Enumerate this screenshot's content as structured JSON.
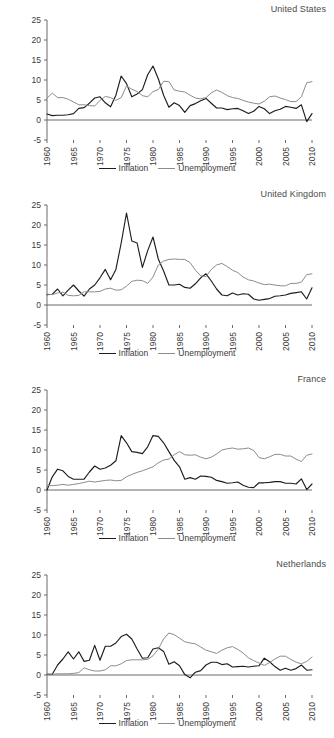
{
  "figure": {
    "legend": {
      "inflation_label": "Inflation",
      "unemployment_label": "Unemployment"
    },
    "colors": {
      "inflation": "#1d1d1d",
      "unemployment": "#8c8c8c",
      "axis": "#6b6b6b",
      "text": "#3a3a3a"
    }
  },
  "chart_data": [
    {
      "type": "line",
      "title": "United States",
      "xlabel": "",
      "ylabel": "",
      "xlim": [
        1960,
        2010
      ],
      "ylim": [
        -5,
        25
      ],
      "ytick_labels": [
        "25",
        "20",
        "15",
        "10",
        "5",
        "0",
        "-5"
      ],
      "yticks": [
        25,
        20,
        15,
        10,
        5,
        0,
        -5
      ],
      "xtick_labels": [
        "1960",
        "1965",
        "1970",
        "1975",
        "1980",
        "1985",
        "1990",
        "1995",
        "2000",
        "2005",
        "2010"
      ],
      "xticks": [
        1960,
        1965,
        1970,
        1975,
        1980,
        1985,
        1990,
        1995,
        2000,
        2005,
        2010
      ],
      "grid": false,
      "legend_position": "bottom-center",
      "x": [
        1960,
        1961,
        1962,
        1963,
        1964,
        1965,
        1966,
        1967,
        1968,
        1969,
        1970,
        1971,
        1972,
        1973,
        1974,
        1975,
        1976,
        1977,
        1978,
        1979,
        1980,
        1981,
        1982,
        1983,
        1984,
        1985,
        1986,
        1987,
        1988,
        1989,
        1990,
        1991,
        1992,
        1993,
        1994,
        1995,
        1996,
        1997,
        1998,
        1999,
        2000,
        2001,
        2002,
        2003,
        2004,
        2005,
        2006,
        2007,
        2008,
        2009,
        2010
      ],
      "series": [
        {
          "name": "Inflation",
          "color": "#1d1d1d",
          "values": [
            1.5,
            1.1,
            1.2,
            1.2,
            1.3,
            1.6,
            2.9,
            3.1,
            4.2,
            5.5,
            5.8,
            4.3,
            3.3,
            6.2,
            11.0,
            9.1,
            5.8,
            6.5,
            7.6,
            11.3,
            13.5,
            10.3,
            6.2,
            3.2,
            4.3,
            3.6,
            1.9,
            3.6,
            4.1,
            4.8,
            5.4,
            4.2,
            3.0,
            3.0,
            2.6,
            2.8,
            2.9,
            2.3,
            1.6,
            2.2,
            3.4,
            2.8,
            1.6,
            2.3,
            2.7,
            3.4,
            3.2,
            2.9,
            3.8,
            -0.4,
            1.6
          ]
        },
        {
          "name": "Unemployment",
          "color": "#8c8c8c",
          "values": [
            5.5,
            6.7,
            5.6,
            5.6,
            5.2,
            4.5,
            3.8,
            3.8,
            3.6,
            3.5,
            4.9,
            5.9,
            5.6,
            4.9,
            5.6,
            8.5,
            7.7,
            7.1,
            6.1,
            5.8,
            7.1,
            7.6,
            9.7,
            9.6,
            7.5,
            7.2,
            7.0,
            6.2,
            5.5,
            5.3,
            5.6,
            6.8,
            7.5,
            6.9,
            6.1,
            5.6,
            5.4,
            4.9,
            4.5,
            4.2,
            4.0,
            4.7,
            5.8,
            6.0,
            5.5,
            5.1,
            4.6,
            4.6,
            5.8,
            9.3,
            9.6
          ]
        }
      ]
    },
    {
      "type": "line",
      "title": "United Kingdom",
      "xlabel": "",
      "ylabel": "",
      "xlim": [
        1960,
        2010
      ],
      "ylim": [
        -5,
        25
      ],
      "ytick_labels": [
        "25",
        "20",
        "15",
        "10",
        "5",
        "0",
        "-5"
      ],
      "yticks": [
        25,
        20,
        15,
        10,
        5,
        0,
        -5
      ],
      "xtick_labels": [
        "1960",
        "1965",
        "1970",
        "1975",
        "1980",
        "1985",
        "1990",
        "1995",
        "2000",
        "2005",
        "2010"
      ],
      "xticks": [
        1960,
        1965,
        1970,
        1975,
        1980,
        1985,
        1990,
        1995,
        2000,
        2005,
        2010
      ],
      "grid": false,
      "legend_position": "bottom-center",
      "x": [
        1960,
        1961,
        1962,
        1963,
        1964,
        1965,
        1966,
        1967,
        1968,
        1969,
        1970,
        1971,
        1972,
        1973,
        1974,
        1975,
        1976,
        1977,
        1978,
        1979,
        1980,
        1981,
        1982,
        1983,
        1984,
        1985,
        1986,
        1987,
        1988,
        1989,
        1990,
        1991,
        1992,
        1993,
        1994,
        1995,
        1996,
        1997,
        1998,
        1999,
        2000,
        2001,
        2002,
        2003,
        2004,
        2005,
        2006,
        2007,
        2008,
        2009,
        2010
      ],
      "series": [
        {
          "name": "Inflation",
          "color": "#1d1d1d",
          "values": [
            2.6,
            2.7,
            4.0,
            2.3,
            3.7,
            5.0,
            3.5,
            2.2,
            4.0,
            5.0,
            6.8,
            8.9,
            6.3,
            8.9,
            15.5,
            23.0,
            16.0,
            15.5,
            9.4,
            13.6,
            17.0,
            11.5,
            8.5,
            5.0,
            5.0,
            5.2,
            4.4,
            4.2,
            5.3,
            6.8,
            7.8,
            6.0,
            4.0,
            2.5,
            2.3,
            3.0,
            2.5,
            2.8,
            2.7,
            1.5,
            1.2,
            1.4,
            1.6,
            2.2,
            2.3,
            2.5,
            2.9,
            3.1,
            3.3,
            1.5,
            4.3
          ]
        },
        {
          "name": "Unemployment",
          "color": "#8c8c8c",
          "values": [
            2.7,
            2.6,
            3.0,
            3.2,
            2.4,
            2.3,
            2.4,
            3.3,
            3.3,
            3.3,
            3.4,
            4.0,
            4.2,
            3.7,
            3.8,
            4.7,
            5.9,
            6.2,
            6.1,
            5.4,
            7.0,
            10.0,
            11.0,
            11.4,
            11.5,
            11.4,
            11.4,
            10.6,
            8.7,
            7.3,
            7.1,
            8.9,
            10.0,
            10.4,
            9.6,
            8.7,
            8.1,
            7.0,
            6.3,
            6.0,
            5.5,
            5.1,
            5.2,
            5.0,
            4.8,
            4.8,
            5.4,
            5.4,
            5.7,
            7.6,
            7.8
          ]
        }
      ]
    },
    {
      "type": "line",
      "title": "France",
      "xlabel": "",
      "ylabel": "",
      "xlim": [
        1960,
        2010
      ],
      "ylim": [
        -5,
        25
      ],
      "ytick_labels": [
        "25",
        "20",
        "15",
        "10",
        "5",
        "0",
        "-5"
      ],
      "yticks": [
        25,
        20,
        15,
        10,
        5,
        0,
        -5
      ],
      "xtick_labels": [
        "1960",
        "1965",
        "1970",
        "1975",
        "1980",
        "1985",
        "1990",
        "1995",
        "2000",
        "2005",
        "2010"
      ],
      "xticks": [
        1960,
        1965,
        1970,
        1975,
        1980,
        1985,
        1990,
        1995,
        2000,
        2005,
        2010
      ],
      "grid": false,
      "legend_position": "bottom-center",
      "x": [
        1960,
        1961,
        1962,
        1963,
        1964,
        1965,
        1966,
        1967,
        1968,
        1969,
        1970,
        1971,
        1972,
        1973,
        1974,
        1975,
        1976,
        1977,
        1978,
        1979,
        1980,
        1981,
        1982,
        1983,
        1984,
        1985,
        1986,
        1987,
        1988,
        1989,
        1990,
        1991,
        1992,
        1993,
        1994,
        1995,
        1996,
        1997,
        1998,
        1999,
        2000,
        2001,
        2002,
        2003,
        2004,
        2005,
        2006,
        2007,
        2008,
        2009,
        2010
      ],
      "series": [
        {
          "name": "Inflation",
          "color": "#1d1d1d",
          "values": [
            0.0,
            3.3,
            5.2,
            4.8,
            3.4,
            2.7,
            2.7,
            2.7,
            4.5,
            6.0,
            5.2,
            5.5,
            6.2,
            7.3,
            13.6,
            11.8,
            9.6,
            9.4,
            9.1,
            10.8,
            13.6,
            13.4,
            11.8,
            9.6,
            7.4,
            5.8,
            2.7,
            3.1,
            2.7,
            3.5,
            3.4,
            3.2,
            2.4,
            2.1,
            1.7,
            1.8,
            2.0,
            1.2,
            0.7,
            0.6,
            1.8,
            1.8,
            1.9,
            2.1,
            2.1,
            1.7,
            1.7,
            1.5,
            2.8,
            0.1,
            1.5
          ]
        },
        {
          "name": "Unemployment",
          "color": "#8c8c8c",
          "values": [
            1.1,
            1.1,
            1.2,
            1.4,
            1.2,
            1.4,
            1.6,
            1.9,
            2.2,
            2.0,
            2.2,
            2.4,
            2.5,
            2.3,
            2.4,
            3.3,
            3.9,
            4.4,
            4.8,
            5.3,
            5.8,
            6.8,
            7.5,
            7.7,
            8.8,
            9.6,
            8.8,
            8.7,
            8.8,
            8.2,
            7.8,
            8.2,
            9.0,
            10.0,
            10.3,
            10.5,
            10.2,
            10.3,
            10.5,
            9.9,
            8.1,
            7.8,
            8.3,
            8.9,
            8.9,
            8.5,
            8.5,
            7.7,
            7.1,
            8.7,
            9.0
          ]
        }
      ]
    },
    {
      "type": "line",
      "title": "Netherlands",
      "xlabel": "",
      "ylabel": "",
      "xlim": [
        1960,
        2010
      ],
      "ylim": [
        -5,
        25
      ],
      "ytick_labels": [
        "25",
        "20",
        "15",
        "10",
        "5",
        "0",
        "-5"
      ],
      "yticks": [
        25,
        20,
        15,
        10,
        5,
        0,
        -5
      ],
      "xtick_labels": [
        "1960",
        "1965",
        "1970",
        "1975",
        "1980",
        "1985",
        "1990",
        "1995",
        "2000",
        "2005",
        "2010"
      ],
      "xticks": [
        1960,
        1965,
        1970,
        1975,
        1980,
        1985,
        1990,
        1995,
        2000,
        2005,
        2010
      ],
      "grid": false,
      "legend_position": "bottom-center",
      "x": [
        1960,
        1961,
        1962,
        1963,
        1964,
        1965,
        1966,
        1967,
        1968,
        1969,
        1970,
        1971,
        1972,
        1973,
        1974,
        1975,
        1976,
        1977,
        1978,
        1979,
        1980,
        1981,
        1982,
        1983,
        1984,
        1985,
        1986,
        1987,
        1988,
        1989,
        1990,
        1991,
        1992,
        1993,
        1994,
        1995,
        1996,
        1997,
        1998,
        1999,
        2000,
        2001,
        2002,
        2003,
        2004,
        2005,
        2006,
        2007,
        2008,
        2009,
        2010
      ],
      "series": [
        {
          "name": "Inflation",
          "color": "#1d1d1d",
          "values": [
            0.2,
            0.2,
            2.5,
            4.0,
            5.8,
            4.0,
            5.8,
            3.4,
            3.7,
            7.4,
            3.7,
            7.2,
            7.2,
            8.0,
            9.6,
            10.2,
            9.0,
            6.5,
            4.2,
            4.3,
            6.5,
            6.8,
            5.9,
            2.7,
            3.3,
            2.3,
            0.1,
            -0.7,
            0.7,
            1.1,
            2.5,
            3.2,
            3.2,
            2.6,
            2.8,
            2.0,
            2.1,
            2.2,
            2.0,
            2.2,
            2.3,
            4.2,
            3.3,
            2.1,
            1.2,
            1.7,
            1.2,
            1.6,
            2.5,
            1.2,
            1.3
          ]
        },
        {
          "name": "Unemployment",
          "color": "#8c8c8c",
          "values": [
            0.2,
            0.2,
            0.3,
            0.3,
            0.3,
            0.4,
            0.6,
            1.8,
            1.3,
            1.0,
            1.0,
            1.3,
            2.3,
            2.3,
            2.8,
            3.6,
            3.8,
            3.8,
            3.8,
            3.9,
            4.8,
            6.5,
            9.0,
            10.5,
            10.1,
            9.2,
            8.3,
            8.0,
            7.8,
            7.0,
            6.2,
            5.8,
            5.4,
            6.2,
            6.8,
            7.1,
            6.4,
            5.5,
            4.3,
            3.6,
            3.0,
            2.4,
            3.1,
            4.0,
            4.7,
            4.7,
            3.9,
            3.2,
            2.8,
            3.4,
            4.5
          ]
        }
      ]
    }
  ]
}
